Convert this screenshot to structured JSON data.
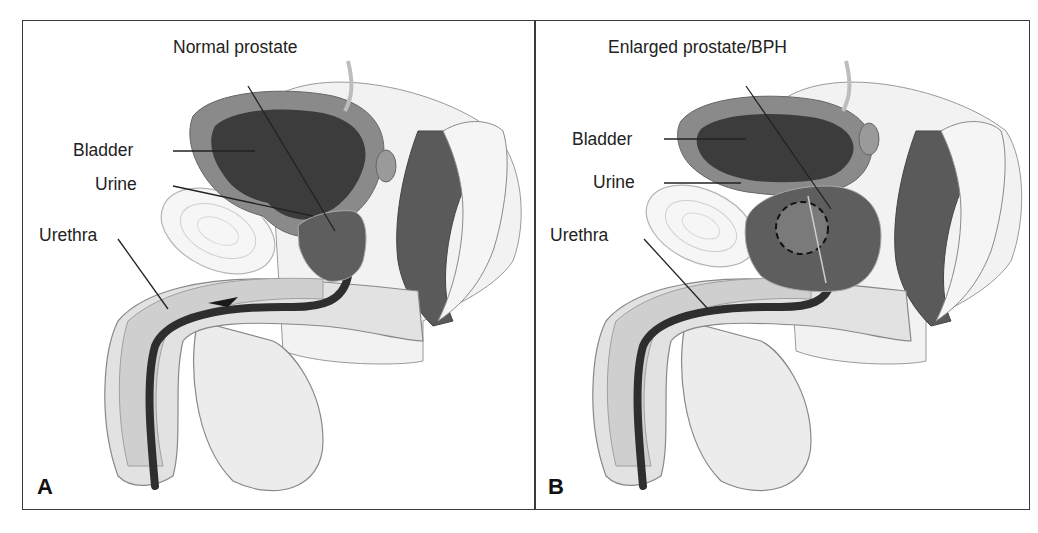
{
  "figure": {
    "panels": [
      {
        "letter": "A",
        "title_label": "Normal prostate",
        "labels": {
          "bladder": "Bladder",
          "urine": "Urine",
          "urethra": "Urethra"
        }
      },
      {
        "letter": "B",
        "title_label": "Enlarged prostate/BPH",
        "labels": {
          "bladder": "Bladder",
          "urine": "Urine",
          "urethra": "Urethra"
        }
      }
    ],
    "colors": {
      "border": "#3a3a3a",
      "bladder_wall": "#8a8a8a",
      "bladder_interior": "#3c3c3c",
      "prostate": "#5e5e5e",
      "urethra": "#2e2e2e",
      "tissue_light": "#e6e6e6",
      "tissue_mid": "#c8c8c8",
      "text": "#222222"
    }
  }
}
